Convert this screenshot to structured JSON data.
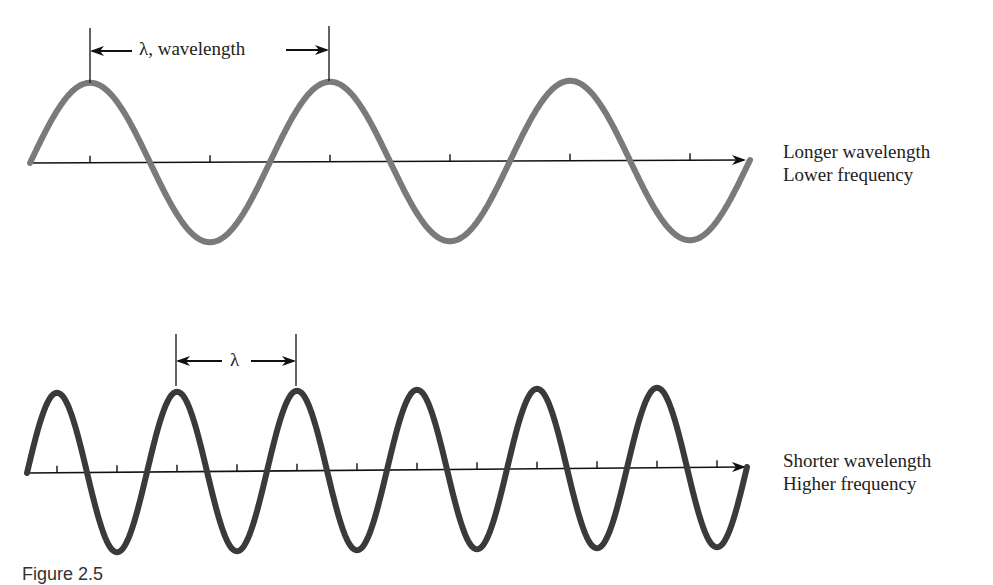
{
  "top_panel": {
    "wavelength_label": "λ, wavelength",
    "description_line1": "Longer wavelength",
    "description_line2": "Lower frequency",
    "wave_color": "#7a7a7a",
    "wavelength_px": 240,
    "amplitude_px": 80,
    "cycles_shown": 3
  },
  "bottom_panel": {
    "wavelength_label": "λ",
    "description_line1": "Shorter wavelength",
    "description_line2": "Higher frequency",
    "wave_color": "#3a3a3a",
    "wavelength_px": 120,
    "amplitude_px": 80,
    "cycles_shown": 6
  },
  "caption": "Figure 2.5"
}
